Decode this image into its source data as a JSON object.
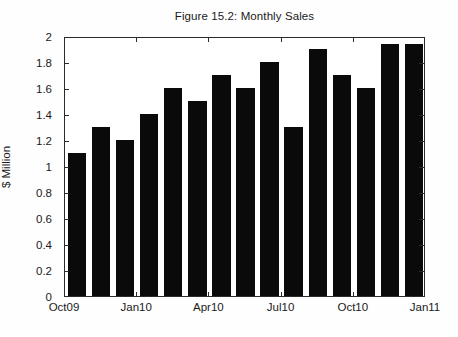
{
  "figure": {
    "title": "Figure 15.2: Monthly Sales",
    "background": "#ffffff",
    "bar_color": "#0a0a0a",
    "axis_color": "#2b2b2b"
  },
  "chart_data": {
    "type": "bar",
    "title": "Figure 15.2: Monthly Sales",
    "xlabel": "",
    "ylabel": "$ Million",
    "ylim": [
      0,
      2
    ],
    "ytick_labels": [
      "0",
      "0.2",
      "0.4",
      "0.6",
      "0.8",
      "1",
      "1.2",
      "1.4",
      "1.6",
      "1.8",
      "2"
    ],
    "ytick_values": [
      0,
      0.2,
      0.4,
      0.6,
      0.8,
      1,
      1.2,
      1.4,
      1.6,
      1.8,
      2
    ],
    "xtick_labels": [
      "Oct09",
      "Jan10",
      "Apr10",
      "Jul10",
      "Oct10",
      "Jan11"
    ],
    "xtick_values": [
      0,
      3,
      6,
      9,
      12,
      15
    ],
    "grid": false,
    "legend": null,
    "categories": [
      "Oct09",
      "Nov09",
      "Dec09",
      "Jan10",
      "Feb10",
      "Mar10",
      "Apr10",
      "May10",
      "Jun10",
      "Jul10",
      "Aug10",
      "Sep10",
      "Oct10",
      "Nov10",
      "Dec10"
    ],
    "x": [
      0,
      1,
      2,
      3,
      4,
      5,
      6,
      7,
      8,
      9,
      10,
      11,
      12,
      13,
      14
    ],
    "values": [
      1.1,
      1.3,
      1.2,
      1.4,
      1.6,
      1.5,
      1.7,
      1.6,
      1.8,
      1.3,
      1.9,
      1.7,
      1.6,
      1.94,
      1.94
    ]
  }
}
